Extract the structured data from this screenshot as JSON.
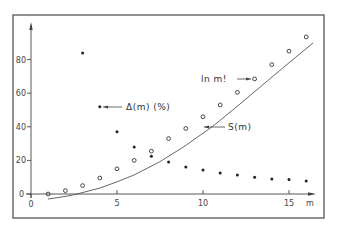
{
  "chart_data": {
    "type": "scatter",
    "title": "",
    "xlabel": "m",
    "ylabel": "",
    "xlim": [
      0,
      17
    ],
    "ylim": [
      0,
      100
    ],
    "grid": false,
    "legend": "none (inline annotations)",
    "x_ticks": [
      0,
      5,
      10,
      15
    ],
    "y_ticks": [
      0,
      20,
      40,
      60,
      80
    ],
    "series": [
      {
        "name": "ln m!",
        "marker": "open-circle",
        "x": [
          1,
          2,
          3,
          4,
          5,
          6,
          7,
          8,
          9,
          10,
          11,
          12,
          13,
          14,
          15,
          16
        ],
        "values": [
          0,
          2,
          5,
          9.5,
          15,
          20,
          25.5,
          33,
          39,
          46,
          53,
          60.5,
          68.5,
          77,
          85,
          93.5
        ]
      },
      {
        "name": "Δ(m) (%)",
        "marker": "filled-dot",
        "x": [
          3,
          4,
          5,
          6,
          7,
          8,
          9,
          10,
          11,
          12,
          13,
          14,
          15,
          16
        ],
        "values": [
          84,
          52,
          37,
          28,
          22.5,
          19,
          16,
          14.3,
          12.5,
          11.3,
          10,
          9,
          8.7,
          7.7
        ]
      },
      {
        "name": "S(m)",
        "marker": "line",
        "x": [
          1,
          2,
          2.7,
          4,
          5,
          6,
          7,
          8,
          9,
          10,
          11,
          12,
          13,
          14,
          15,
          16.4
        ],
        "values": [
          -3,
          -1.5,
          0,
          3.5,
          6.5,
          11,
          16,
          22,
          28,
          34.5,
          41,
          48,
          56,
          64,
          73,
          90
        ]
      }
    ],
    "annotations": [
      {
        "text": "Δ(m) (%)",
        "points_to": "series Δ(m)",
        "at_x": 4,
        "at_y": 52
      },
      {
        "text": "S(m)",
        "points_to": "curve S(m)",
        "at_x": 10,
        "at_y": 40
      },
      {
        "text": "ln m!",
        "points_to": "series ln m!",
        "at_x": 13,
        "at_y": 68.5
      }
    ]
  },
  "labels": {
    "x_axis_unit": "m",
    "anno_delta": "Δ(m) (%)",
    "anno_s": "S(m)",
    "anno_lnm": "ln m!",
    "xt0": "0",
    "xt5": "5",
    "xt10": "10",
    "xt15": "15",
    "yt0": "0",
    "yt20": "20",
    "yt40": "40",
    "yt60": "60",
    "yt80": "80"
  }
}
